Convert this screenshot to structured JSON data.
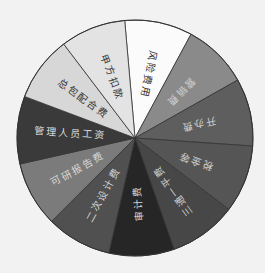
{
  "chart_data": {
    "type": "pie",
    "title": "",
    "legend": "none",
    "labels_inside": true,
    "center": [
      135,
      138
    ],
    "radius": 118,
    "start_angle_deg": -95,
    "slices": [
      {
        "label": "风险费用",
        "value": 8.6,
        "color": "#fbfbfb",
        "text_color": "#333333"
      },
      {
        "label": "营销费",
        "value": 8.3,
        "color": "#8a8a8a",
        "text_color": "#d0d0d0"
      },
      {
        "label": "开办费",
        "value": 8.6,
        "color": "#5e5e5e",
        "text_color": "#cfcfcf"
      },
      {
        "label": "税金等",
        "value": 8.6,
        "color": "#555555",
        "text_color": "#cfcfcf"
      },
      {
        "label": "三通一平费",
        "value": 8.6,
        "color": "#474747",
        "text_color": "#d0d0d0"
      },
      {
        "label": "审计费",
        "value": 8.3,
        "color": "#262626",
        "text_color": "#d8d8d8"
      },
      {
        "label": "二次设计费",
        "value": 8.3,
        "color": "#505050",
        "text_color": "#d0d0d0"
      },
      {
        "label": "可研报告费",
        "value": 8.3,
        "color": "#7b7b7b",
        "text_color": "#d8d8d8"
      },
      {
        "label": "管理人员工资",
        "value": 8.6,
        "color": "#3a3a3a",
        "text_color": "#d8d8d8"
      },
      {
        "label": "总包配合费",
        "value": 8.3,
        "color": "#d7d7d7",
        "text_color": "#333333"
      },
      {
        "label": "甲方扣款",
        "value": 8.3,
        "color": "#e3e3e3",
        "text_color": "#333333"
      }
    ]
  }
}
